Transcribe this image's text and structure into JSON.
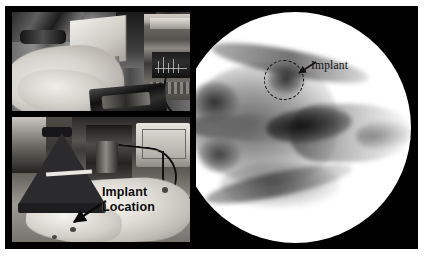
{
  "figure": {
    "type": "multi-panel-scientific-figure",
    "background": "#ffffff",
    "frame_color": "#000000",
    "panel_count": 3
  },
  "panels": {
    "lab_setup": {
      "name": "top-left-photo",
      "description": "Laboratory bench photograph with measurement instrument rack, cables, white surgical drape and a black equipment case",
      "position": "top-left",
      "annotations": []
    },
    "antenna_setup": {
      "name": "bottom-left-photo",
      "description": "Photograph of a black pyramidal horn antenna aimed at an anesthetized white animal lying on a drape, with rack instrumentation and an oscilloscope in the background",
      "position": "bottom-left",
      "annotations": [
        {
          "id": "implant-location",
          "line1": "Implant",
          "line2": "Location",
          "style": "bold-sans",
          "color": "#0a0a0a",
          "arrow": "points down-left toward the animal"
        }
      ]
    },
    "xray": {
      "name": "right-panel-xray",
      "description": "Circular fluoroscopic X-ray (radiograph) of a rodent head in dorsal view showing skull, orbits, and snout",
      "position": "right",
      "shape": "circle",
      "background": "#000000",
      "annotations": [
        {
          "id": "implant-callout",
          "label": "Implant",
          "style": "serif",
          "color": "#111111",
          "marker": "dashed-circle",
          "arrow": "points down-left to the dashed circle"
        }
      ]
    }
  },
  "labels": {
    "implant_line1": "Implant",
    "implant_line2": "Location",
    "implant_xray": "Implant"
  },
  "colors": {
    "frame": "#000000",
    "page_background": "#ffffff",
    "xray_background": "#000000",
    "xray_field": "#ffffff",
    "annotation_text": "#0a0a0a",
    "dashed_marker": "#0d0d0d"
  }
}
